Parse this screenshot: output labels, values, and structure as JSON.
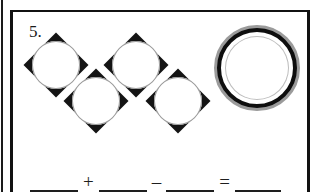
{
  "worksheet": {
    "problem_number": "5.",
    "shapes": {
      "diamond_tokens": [
        {
          "name": "diamond-circle-1",
          "position": "top-left"
        },
        {
          "name": "diamond-circle-2",
          "position": "top-right"
        },
        {
          "name": "diamond-circle-3",
          "position": "bottom-left"
        },
        {
          "name": "diamond-circle-4",
          "position": "bottom-right"
        }
      ],
      "diamond_count": 4,
      "ring": {
        "name": "ring-shape",
        "position": "far-right"
      },
      "ring_count": 1
    },
    "equation": {
      "blank_1": "",
      "operator_1": "+",
      "blank_2": "",
      "operator_2": "–",
      "blank_3": "",
      "operator_3": "=",
      "blank_4": ""
    },
    "colors": {
      "ink": "#141414",
      "ring_gray": "#9b9b9b",
      "paper": "#ffffff"
    }
  }
}
